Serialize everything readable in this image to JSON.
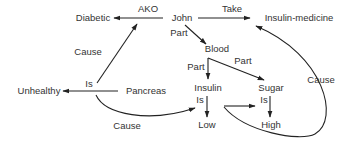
{
  "diagram": {
    "type": "semantic-network",
    "colors": {
      "text": "#333333",
      "line": "#222222",
      "background": "#ffffff"
    },
    "nodes": {
      "diabetic": "Diabetic",
      "john": "John",
      "insulin_medicine": "Insulin-medicine",
      "blood": "Blood",
      "unhealthy": "Unhealthy",
      "pancreas": "Pancreas",
      "insulin": "Insulin",
      "sugar": "Sugar",
      "low": "Low",
      "high": "High"
    },
    "edge_labels": {
      "ako": "AKO",
      "take": "Take",
      "john_blood_part": "Part",
      "blood_insulin_part": "Part",
      "blood_sugar_part": "Part",
      "pancreas_diabetic_cause": "Cause",
      "pancreas_unhealthy_is": "Is",
      "pancreas_low_cause": "Cause",
      "insulin_low_is": "Is",
      "sugar_high_is": "Is",
      "loop_medicine_cause": "Cause"
    },
    "edges": [
      {
        "from": "John",
        "to": "Diabetic",
        "label": "AKO"
      },
      {
        "from": "John",
        "to": "Insulin-medicine",
        "label": "Take"
      },
      {
        "from": "John",
        "to": "Blood",
        "label": "Part"
      },
      {
        "from": "Blood",
        "to": "Insulin",
        "label": "Part"
      },
      {
        "from": "Blood",
        "to": "Sugar",
        "label": "Part"
      },
      {
        "from": "Pancreas",
        "to": "Diabetic",
        "label": "Cause"
      },
      {
        "from": "Pancreas",
        "to": "Unhealthy",
        "label": "Is"
      },
      {
        "from": "Pancreas",
        "to": "Low",
        "label": "Cause"
      },
      {
        "from": "Insulin",
        "to": "Low",
        "label": "Is"
      },
      {
        "from": "Sugar",
        "to": "High",
        "label": "Is"
      },
      {
        "from": "Insulin is Low",
        "to": "Sugar is High",
        "label": ""
      },
      {
        "from": "Insulin is Low",
        "to": "Insulin-medicine",
        "label": "Cause"
      }
    ]
  }
}
